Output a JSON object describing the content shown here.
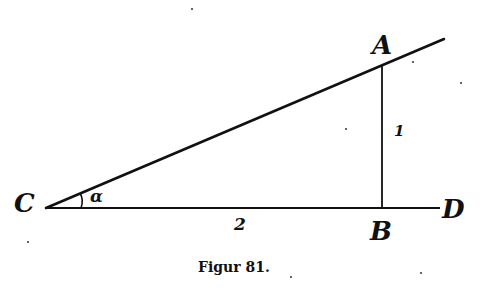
{
  "figure": {
    "caption": "Figur 81.",
    "points": {
      "C": "C",
      "A": "A",
      "B": "B",
      "D": "D"
    },
    "angle_label": "α",
    "side_labels": {
      "AB": "1",
      "CB": "2"
    },
    "stroke_color": "#111111",
    "background": "#ffffff"
  }
}
